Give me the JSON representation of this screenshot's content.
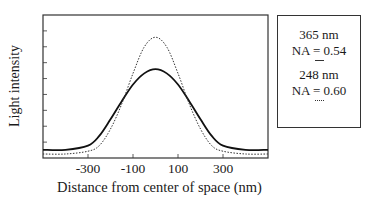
{
  "chart_data": {
    "type": "line",
    "title": "",
    "xlabel": "Distance from center of space (nm)",
    "ylabel": "Light intensity",
    "xlim": [
      -500,
      500
    ],
    "ylim": [
      0,
      1
    ],
    "x_ticks": [
      -300,
      -100,
      100,
      300
    ],
    "x_tick_labels": [
      "-300",
      "-100",
      "100",
      "300"
    ],
    "y_ticks_unlabeled": 8,
    "grid": false,
    "legend_position": "right-outside",
    "series": [
      {
        "name": "365 nm, NA = 0.54",
        "style": "solid",
        "x": [
          -500,
          -400,
          -300,
          -250,
          -200,
          -150,
          -100,
          -50,
          0,
          50,
          100,
          150,
          200,
          250,
          300,
          400,
          500
        ],
        "y": [
          0.03,
          0.03,
          0.06,
          0.13,
          0.25,
          0.38,
          0.5,
          0.58,
          0.61,
          0.58,
          0.5,
          0.38,
          0.25,
          0.13,
          0.06,
          0.03,
          0.03
        ]
      },
      {
        "name": "248 nm, NA = 0.60",
        "style": "dotted",
        "x": [
          -500,
          -400,
          -300,
          -250,
          -200,
          -150,
          -100,
          -50,
          0,
          50,
          100,
          150,
          200,
          250,
          300,
          400,
          500
        ],
        "y": [
          0.0,
          0.0,
          0.02,
          0.06,
          0.18,
          0.36,
          0.58,
          0.77,
          0.84,
          0.77,
          0.58,
          0.36,
          0.18,
          0.06,
          0.02,
          0.0,
          0.0
        ]
      }
    ]
  },
  "legend": {
    "entries": [
      {
        "wavelength": "365 nm",
        "na": "NA = 0.54",
        "line": "solid"
      },
      {
        "wavelength": "248 nm",
        "na": "NA = 0.60",
        "line": "dotted"
      }
    ]
  }
}
